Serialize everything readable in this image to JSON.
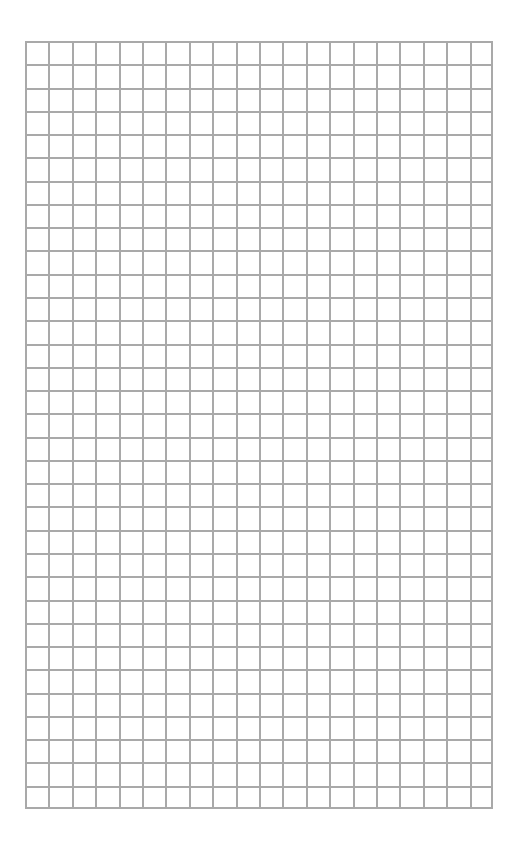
{
  "page": {
    "type": "graph-paper",
    "background_color": "#ffffff",
    "grid": {
      "columns": 20,
      "rows": 33,
      "line_color": "#a9a9a9"
    }
  }
}
